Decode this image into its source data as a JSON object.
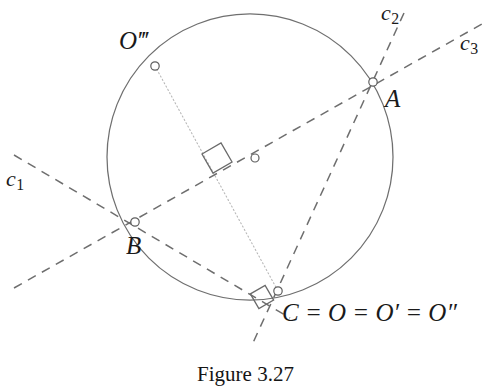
{
  "figure": {
    "caption": "Figure 3.27",
    "caption_top": 362,
    "background": "#ffffff",
    "stroke_color": "#6b6b6b",
    "dash_color": "#707070",
    "dot_color": "#b0b0b0",
    "text_color": "#1a1a1a"
  },
  "circle": {
    "label": "circumscribed-circle",
    "cx": 250,
    "cy": 157,
    "r": 143
  },
  "points": [
    {
      "id": "A",
      "label": "A",
      "x": 373,
      "y": 82,
      "label_x": 385,
      "label_y": 86
    },
    {
      "id": "B",
      "label": "B",
      "x": 135,
      "y": 222,
      "label_x": 126,
      "label_y": 233
    },
    {
      "id": "C",
      "label": "C = O = O′ = O″",
      "x": 278,
      "y": 291,
      "label_x": 282,
      "label_y": 300
    },
    {
      "id": "Otriple",
      "label": "O‴",
      "x": 155,
      "y": 66,
      "label_x": 119,
      "label_y": 28
    },
    {
      "id": "M",
      "label": "midpoint-marker",
      "x": 255,
      "y": 158,
      "label_x": null,
      "label_y": null
    }
  ],
  "lines": [
    {
      "id": "c1",
      "label": "c",
      "subscript": "1",
      "x1": 14,
      "y1": 155,
      "x2": 290,
      "y2": 318,
      "label_x": 6,
      "label_y": 168
    },
    {
      "id": "c2",
      "label": "c",
      "subscript": "2",
      "x1": 404,
      "y1": 13,
      "x2": 252,
      "y2": 345,
      "label_x": 381,
      "label_y": 2
    },
    {
      "id": "c3",
      "label": "c",
      "subscript": "3",
      "x1": 14,
      "y1": 288,
      "x2": 482,
      "y2": 24,
      "label_x": 460,
      "label_y": 32
    }
  ],
  "chords": [
    {
      "id": "chord-Otriple-C",
      "from": "Otriple",
      "to": "C",
      "style": "dotted"
    }
  ],
  "right_angles": [
    {
      "id": "right-angle-center",
      "x": 217,
      "y": 158,
      "size": 22,
      "rotation": -30
    },
    {
      "id": "right-angle-at-C",
      "x": 262,
      "y": 297,
      "size": 17,
      "rotation": -30
    }
  ]
}
